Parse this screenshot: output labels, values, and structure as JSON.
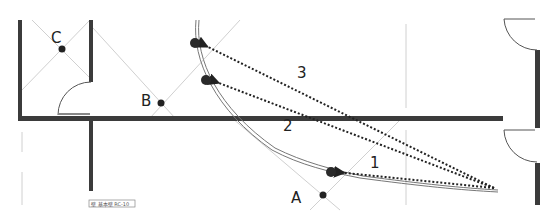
{
  "diagram": {
    "title": "",
    "colors": {
      "wall": "#3b3b3b",
      "guide": "#cccccc",
      "path": "#777777",
      "point": "#222222",
      "arrow": "#222222",
      "label": "#222222"
    },
    "points": [
      {
        "id": "A",
        "label": "A",
        "x": 323,
        "y": 195
      },
      {
        "id": "B",
        "label": "B",
        "x": 161,
        "y": 103
      },
      {
        "id": "C",
        "label": "C",
        "x": 62,
        "y": 49
      }
    ],
    "path_points": [
      {
        "id": "p3",
        "x": 195,
        "y": 43
      },
      {
        "id": "p2",
        "x": 206,
        "y": 80
      },
      {
        "id": "p1",
        "x": 331,
        "y": 172
      }
    ],
    "arrows": [
      {
        "id": "arrow-1",
        "label": "1",
        "from_x": 494,
        "from_y": 188,
        "to_x": 336,
        "to_y": 172,
        "label_x": 370,
        "label_y": 167
      },
      {
        "id": "arrow-2",
        "label": "2",
        "from_x": 494,
        "from_y": 188,
        "to_x": 211,
        "to_y": 80,
        "label_x": 284,
        "label_y": 131
      },
      {
        "id": "arrow-3",
        "label": "3",
        "from_x": 494,
        "from_y": 188,
        "to_x": 200,
        "to_y": 43,
        "label_x": 298,
        "label_y": 77
      }
    ],
    "tag": {
      "text": "壁 基本壁 RC-10"
    }
  }
}
